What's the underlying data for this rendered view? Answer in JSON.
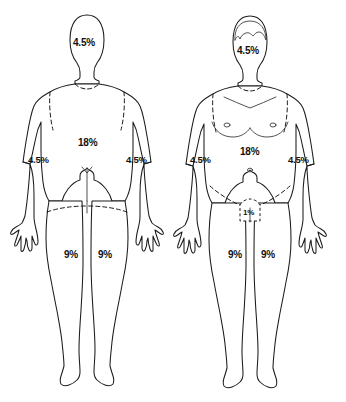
{
  "diagram": {
    "type": "anatomical-percentage-diagram",
    "stroke_color": "#1b1b1b",
    "background_color": "#ffffff",
    "label_color": "#111111"
  },
  "figures": [
    {
      "view": "posterior",
      "name": "back-view-figure",
      "labels": [
        {
          "name": "head-label",
          "value": "4.5%"
        },
        {
          "name": "back-torso-label",
          "value": "18%"
        },
        {
          "name": "left-arm-label",
          "value": "4.5%"
        },
        {
          "name": "right-arm-label",
          "value": "4.5%"
        },
        {
          "name": "left-leg-label",
          "value": "9%"
        },
        {
          "name": "right-leg-label",
          "value": "9%"
        }
      ]
    },
    {
      "view": "anterior",
      "name": "front-view-figure",
      "labels": [
        {
          "name": "head-label",
          "value": "4.5%"
        },
        {
          "name": "front-torso-label",
          "value": "18%"
        },
        {
          "name": "left-arm-label",
          "value": "4.5%"
        },
        {
          "name": "right-arm-label",
          "value": "4.5%"
        },
        {
          "name": "genital-label",
          "value": "1%"
        },
        {
          "name": "left-leg-label",
          "value": "9%"
        },
        {
          "name": "right-leg-label",
          "value": "9%"
        }
      ]
    }
  ]
}
